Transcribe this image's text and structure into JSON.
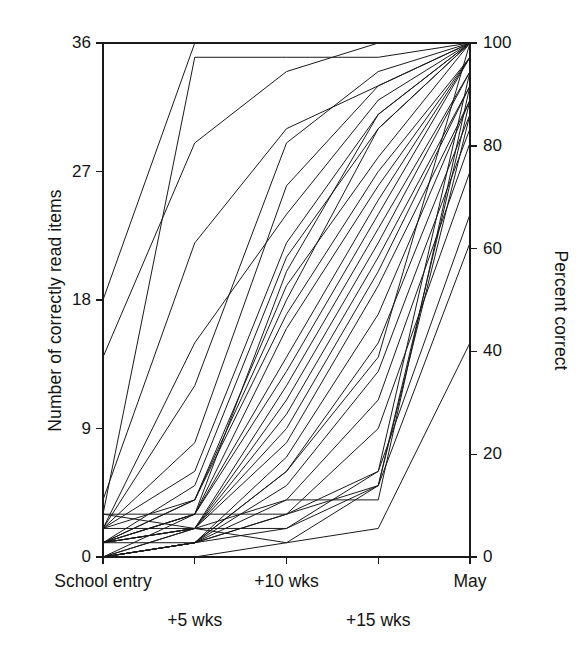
{
  "figure": {
    "title": "",
    "background": "#ffffff",
    "line_color": "#1a1a1a",
    "axis_color": "#1a1a1a"
  },
  "axes": {
    "left": {
      "title": "Number of correctly read items",
      "ticks": [
        0,
        9,
        18,
        27,
        36
      ],
      "tick_labels": [
        "0",
        "9",
        "18",
        "27",
        "36"
      ],
      "min": 0,
      "max": 36
    },
    "right": {
      "title": "Percent correct",
      "ticks": [
        0,
        20,
        40,
        60,
        80,
        100
      ],
      "tick_labels": [
        "0",
        "20",
        "40",
        "60",
        "80",
        "100"
      ],
      "min": 0,
      "max": 100
    },
    "x": {
      "title": "",
      "labels_row1": [
        "School entry",
        "",
        "+10 wks",
        "",
        "May"
      ],
      "labels_row2": [
        "",
        "+5 wks",
        "",
        "+15 wks",
        ""
      ]
    }
  },
  "chart_data": {
    "type": "line",
    "title": "",
    "xlabel": "",
    "ylabel": "Number of correctly read items",
    "y2label": "Percent correct",
    "ylim": [
      0,
      36
    ],
    "y2lim": [
      0,
      100
    ],
    "grid": false,
    "legend": "none",
    "categories": [
      "School entry",
      "+5 wks",
      "+10 wks",
      "+15 wks",
      "May"
    ],
    "x_positions": [
      0,
      1,
      2,
      3,
      4
    ],
    "note": "Each series is one child; values are number of correctly read items out of 36. Right axis is the same values expressed as percent correct (value/36*100).",
    "series": [
      {
        "name": "child-01",
        "values": [
          18,
          36,
          36,
          36,
          36
        ]
      },
      {
        "name": "child-02",
        "values": [
          14,
          29,
          34,
          36,
          36
        ]
      },
      {
        "name": "child-03",
        "values": [
          4,
          22,
          30,
          33,
          36
        ]
      },
      {
        "name": "child-04",
        "values": [
          3,
          35,
          35,
          35,
          36
        ]
      },
      {
        "name": "child-05",
        "values": [
          2,
          15,
          24,
          32,
          36
        ]
      },
      {
        "name": "child-06",
        "values": [
          2,
          12,
          29,
          34,
          36
        ]
      },
      {
        "name": "child-07",
        "values": [
          2,
          8,
          26,
          33,
          36
        ]
      },
      {
        "name": "child-08",
        "values": [
          2,
          6,
          22,
          31,
          36
        ]
      },
      {
        "name": "child-09",
        "values": [
          1,
          5,
          21,
          30,
          36
        ]
      },
      {
        "name": "child-10",
        "values": [
          1,
          4,
          19,
          28,
          36
        ]
      },
      {
        "name": "child-11",
        "values": [
          1,
          4,
          17,
          27,
          35
        ]
      },
      {
        "name": "child-12",
        "values": [
          1,
          3,
          16,
          26,
          35
        ]
      },
      {
        "name": "child-13",
        "values": [
          1,
          3,
          14,
          25,
          35
        ]
      },
      {
        "name": "child-14",
        "values": [
          1,
          3,
          13,
          24,
          35
        ]
      },
      {
        "name": "child-15",
        "values": [
          1,
          2,
          12,
          23,
          34
        ]
      },
      {
        "name": "child-16",
        "values": [
          1,
          2,
          11,
          22,
          34
        ]
      },
      {
        "name": "child-17",
        "values": [
          1,
          2,
          10,
          21,
          33
        ]
      },
      {
        "name": "child-18",
        "values": [
          0,
          2,
          9,
          20,
          33
        ]
      },
      {
        "name": "child-19",
        "values": [
          0,
          2,
          8,
          19,
          32
        ]
      },
      {
        "name": "child-20",
        "values": [
          0,
          1,
          7,
          17,
          32
        ]
      },
      {
        "name": "child-21",
        "values": [
          0,
          1,
          6,
          15,
          31
        ]
      },
      {
        "name": "child-22",
        "values": [
          0,
          1,
          5,
          13,
          30
        ]
      },
      {
        "name": "child-23",
        "values": [
          0,
          1,
          4,
          11,
          29
        ]
      },
      {
        "name": "child-24",
        "values": [
          0,
          1,
          3,
          9,
          27
        ]
      },
      {
        "name": "child-25",
        "values": [
          0,
          1,
          3,
          6,
          24
        ]
      },
      {
        "name": "child-26",
        "values": [
          0,
          1,
          2,
          5,
          22
        ]
      },
      {
        "name": "child-27",
        "values": [
          3,
          3,
          3,
          5,
          32
        ]
      },
      {
        "name": "child-28",
        "values": [
          2,
          2,
          2,
          6,
          34
        ]
      },
      {
        "name": "child-29",
        "values": [
          1,
          2,
          4,
          4,
          33
        ]
      },
      {
        "name": "child-30",
        "values": [
          0,
          0,
          1,
          2,
          15
        ]
      },
      {
        "name": "child-31",
        "values": [
          3,
          2,
          1,
          5,
          31
        ]
      },
      {
        "name": "child-32",
        "values": [
          1,
          1,
          6,
          14,
          36
        ]
      },
      {
        "name": "child-33",
        "values": [
          2,
          4,
          18,
          30,
          36
        ]
      },
      {
        "name": "child-34",
        "values": [
          0,
          3,
          20,
          31,
          36
        ]
      }
    ]
  },
  "geometry": {
    "plot_left": 103,
    "plot_right": 470,
    "plot_top": 43,
    "plot_bottom": 557
  }
}
